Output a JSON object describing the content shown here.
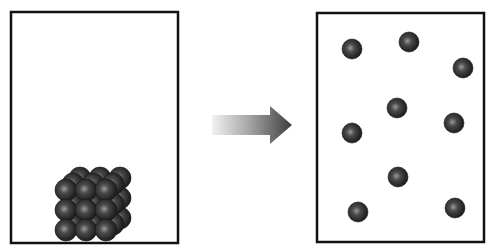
{
  "diagram": {
    "title": "",
    "colors": {
      "background": "#ffffff",
      "box_border": "#111111",
      "particle_dark": "#1a1a1a",
      "particle_mid": "#3a3a3a",
      "particle_highlight": "#9a9a9a",
      "arrow_dark": "#4a4a4a",
      "arrow_light": "#f2f2f2"
    },
    "left_box": {
      "label": "",
      "state": "packed particles",
      "x": 11,
      "y": 12,
      "w": 167,
      "h": 231,
      "cluster": {
        "rows": 3,
        "cols": 3,
        "layers": 3,
        "origin_x": 66,
        "origin_y": 190,
        "spacing": 20,
        "layer_dx": 7,
        "layer_dy": -6,
        "r": 11
      }
    },
    "arrow": {
      "label": "",
      "direction": "right",
      "shaft_x1": 212,
      "shaft_x2": 270,
      "shaft_y1": 115,
      "shaft_y2": 135,
      "head_top": 106,
      "head_bottom": 144,
      "tip_x": 292,
      "tip_y": 125
    },
    "right_box": {
      "label": "",
      "state": "dispersed particles",
      "x": 317,
      "y": 13,
      "w": 167,
      "h": 229,
      "particles": [
        {
          "cx": 352,
          "cy": 49
        },
        {
          "cx": 409,
          "cy": 42
        },
        {
          "cx": 463,
          "cy": 68
        },
        {
          "cx": 397,
          "cy": 108
        },
        {
          "cx": 352,
          "cy": 133
        },
        {
          "cx": 454,
          "cy": 123
        },
        {
          "cx": 398,
          "cy": 177
        },
        {
          "cx": 358,
          "cy": 212
        },
        {
          "cx": 455,
          "cy": 208
        }
      ],
      "particle_r": 10
    }
  }
}
